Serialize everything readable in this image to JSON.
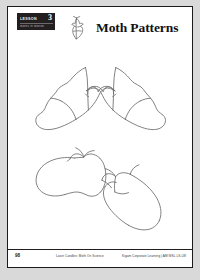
{
  "page": {
    "background_color": "#d9d9d9",
    "sheet_color": "#ffffff",
    "border_color": "#1a1a1a"
  },
  "header": {
    "badge": {
      "label": "Lesson",
      "number": "3",
      "subtitle": "Moths in Motion",
      "background_color": "#231f20",
      "text_color": "#ffffff"
    },
    "icon_name": "moth-illustration-icon",
    "title": "Moth Patterns"
  },
  "worksheet": {
    "figure_caption": "Four hand-drawn moth wing outlines",
    "figures": [
      {
        "name": "moth-outline-top-left",
        "orientation": "wings-up-left"
      },
      {
        "name": "moth-outline-top-right",
        "orientation": "wings-up-right"
      },
      {
        "name": "moth-outline-bottom-left",
        "orientation": "wings-spread-horizontal"
      },
      {
        "name": "moth-outline-bottom-right",
        "orientation": "wings-spread-right"
      }
    ],
    "ink_color": "#6b6b6b"
  },
  "footer": {
    "page_number": "98",
    "credit_left": "Laser Candles: Moth On Science",
    "credit_right": "Kigam Corporate Learning | AM WSL.LS-LW"
  }
}
